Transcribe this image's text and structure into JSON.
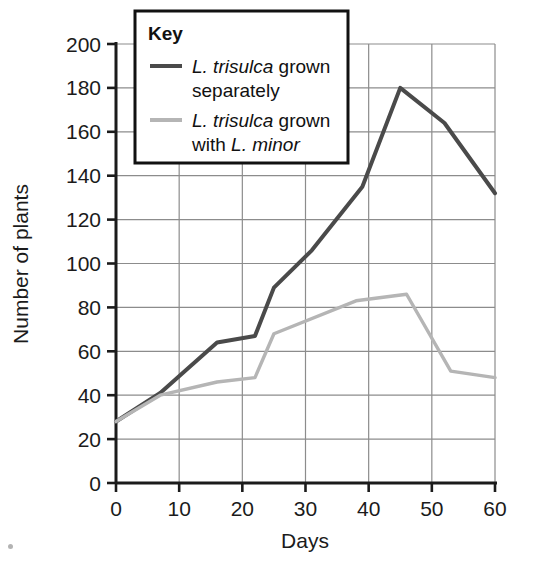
{
  "chart_data": {
    "type": "line",
    "title": "",
    "xlabel": "Days",
    "ylabel": "Number of plants",
    "xlim": [
      0,
      60
    ],
    "ylim": [
      0,
      200
    ],
    "xticks": [
      0,
      10,
      20,
      30,
      40,
      50,
      60
    ],
    "yticks": [
      0,
      20,
      40,
      60,
      80,
      100,
      120,
      140,
      160,
      180,
      200
    ],
    "xtick_labels": [
      "0",
      "10",
      "20",
      "30",
      "40",
      "50",
      "60"
    ],
    "ytick_labels": [
      "0",
      "20",
      "40",
      "60",
      "80",
      "100",
      "120",
      "140",
      "160",
      "180",
      "200"
    ],
    "grid": true,
    "legend_position": "top-left-inside",
    "legend_title": "Key",
    "series": [
      {
        "name": "L. trisulca grown separately",
        "name_parts": [
          {
            "text": "L. trisulca",
            "italic": true
          },
          {
            "text": " grown separately",
            "italic": false
          }
        ],
        "color": "#4a4a4a",
        "points": [
          {
            "x": 0,
            "y": 28
          },
          {
            "x": 7,
            "y": 41
          },
          {
            "x": 16,
            "y": 64
          },
          {
            "x": 22,
            "y": 67
          },
          {
            "x": 25,
            "y": 89
          },
          {
            "x": 31,
            "y": 106
          },
          {
            "x": 39,
            "y": 135
          },
          {
            "x": 45,
            "y": 180
          },
          {
            "x": 52,
            "y": 164
          },
          {
            "x": 60,
            "y": 132
          }
        ]
      },
      {
        "name": "L. trisulca grown with L. minor",
        "name_parts": [
          {
            "text": "L. trisulca",
            "italic": true
          },
          {
            "text": " grown with ",
            "italic": false
          },
          {
            "text": "L. minor",
            "italic": true
          }
        ],
        "color": "#b5b5b5",
        "points": [
          {
            "x": 0,
            "y": 28
          },
          {
            "x": 7,
            "y": 40
          },
          {
            "x": 16,
            "y": 46
          },
          {
            "x": 22,
            "y": 48
          },
          {
            "x": 25,
            "y": 68
          },
          {
            "x": 38,
            "y": 83
          },
          {
            "x": 46,
            "y": 86
          },
          {
            "x": 53,
            "y": 51
          },
          {
            "x": 60,
            "y": 48
          }
        ]
      }
    ]
  },
  "legend": {
    "title": "Key",
    "entries": [
      {
        "line1_italic": "L. trisulca",
        "line1_rest": " grown",
        "line2": "separately"
      },
      {
        "line1_italic": "L. trisulca",
        "line1_rest": " grown",
        "line2_plain": "with ",
        "line2_italic": "L. minor"
      }
    ]
  },
  "axes": {
    "x_title": "Days",
    "y_title": "Number of plants"
  },
  "colors": {
    "series_dark": "#4a4a4a",
    "series_light": "#b5b5b5",
    "grid": "#8c8c8c",
    "axis": "#1b1b1b",
    "background": "#ffffff"
  }
}
